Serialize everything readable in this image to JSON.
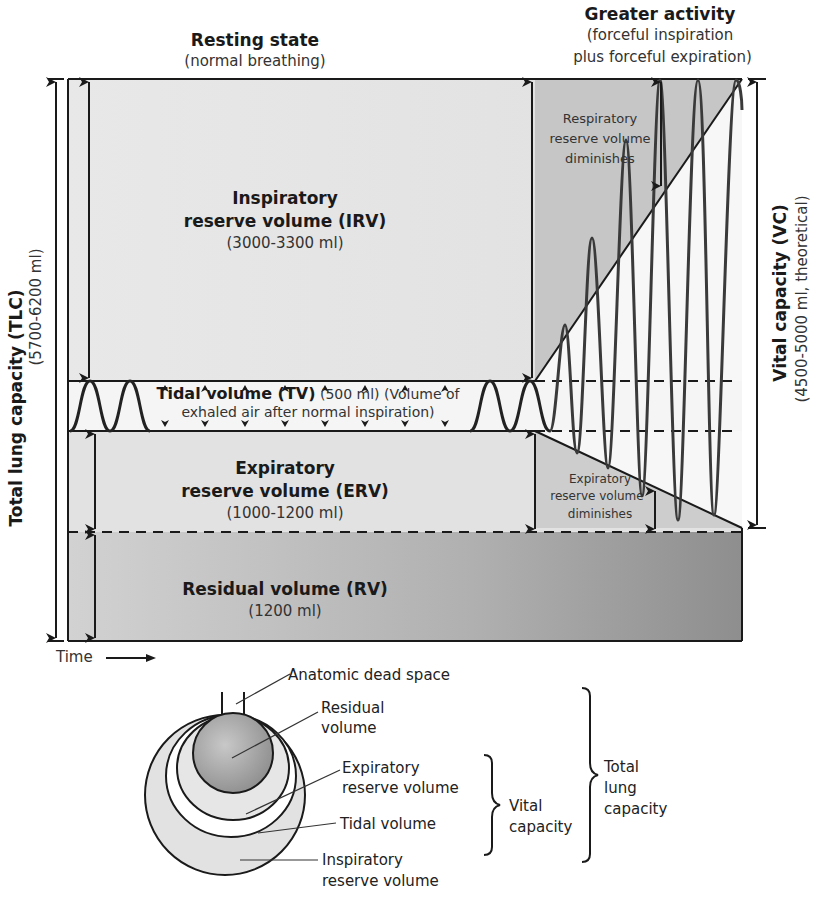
{
  "header": {
    "resting": {
      "title": "Resting state",
      "subtitle": "(normal breathing)"
    },
    "activity": {
      "title": "Greater activity",
      "subtitle_line1": "(forceful inspiration",
      "subtitle_line2": "plus forceful expiration)"
    }
  },
  "volumes": {
    "irv": {
      "line1": "Inspiratory",
      "line2": "reserve volume (IRV)",
      "value": "(3000-3300 ml)"
    },
    "tv": {
      "bold": "Tidal volume (TV)",
      "rest": " (500 ml) (Volume of",
      "line2": "exhaled air after normal inspiration)"
    },
    "erv": {
      "line1": "Expiratory",
      "line2": "reserve volume (ERV)",
      "value": "(1000-1200 ml)"
    },
    "rv": {
      "line1": "Residual volume (RV)",
      "value": "(1200 ml)"
    }
  },
  "annotations": {
    "irv_diminishes": [
      "Respiratory",
      "reserve volume",
      "diminishes"
    ],
    "erv_diminishes": [
      "Expiratory",
      "reserve volume",
      "diminishes"
    ]
  },
  "axes": {
    "tlc": {
      "title": "Total lung capacity (TLC)",
      "value": "(5700-6200 ml)"
    },
    "vc": {
      "title": "Vital capacity (VC)",
      "value": "(4500-5000 ml, theoretical)"
    },
    "time_label": "Time"
  },
  "lung_diagram": {
    "labels": {
      "dead_space": "Anatomic dead space",
      "residual": [
        "Residual",
        "volume"
      ],
      "expiratory": [
        "Expiratory",
        "reserve volume"
      ],
      "tidal": "Tidal volume",
      "inspiratory": [
        "Inspiratory",
        "reserve volume"
      ]
    },
    "brackets": {
      "vital": [
        "Vital",
        "capacity"
      ],
      "total": [
        "Total",
        "lung",
        "capacity"
      ]
    }
  },
  "colors": {
    "irv_fill": "#e6e6e6",
    "irv_shaded": "#c9c9c9",
    "erv_fill": "#e4e4e4",
    "rv_fill_left": "#cfcfcf",
    "rv_fill_right": "#8f8f8f",
    "tidal_band": "#f4f4f4",
    "line": "#1a1a1a",
    "wave": "#3a3a3a"
  }
}
